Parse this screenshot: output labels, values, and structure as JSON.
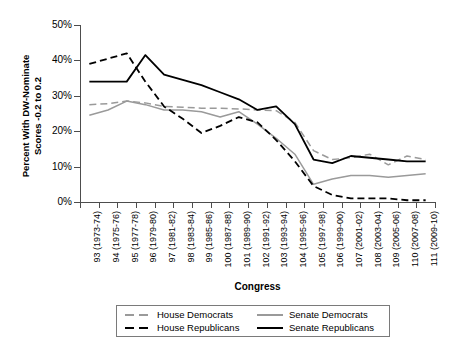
{
  "axes": {
    "y_title_line1": "Percent With DW-Nominate",
    "y_title_line2": "Scores -0.2 to 0.2",
    "x_title": "Congress",
    "y_ticks": [
      "0%",
      "10%",
      "20%",
      "30%",
      "40%",
      "50%"
    ]
  },
  "legend": {
    "items": [
      {
        "label": "House Democrats",
        "style": "dashed",
        "color": "#9a9a9a"
      },
      {
        "label": "Senate Democrats",
        "style": "solid",
        "color": "#9a9a9a"
      },
      {
        "label": "House Republicans",
        "style": "dashed",
        "color": "#000000"
      },
      {
        "label": "Senate Republicans",
        "style": "solid",
        "color": "#000000"
      }
    ]
  },
  "chart_data": {
    "type": "line",
    "title": "",
    "xlabel": "Congress",
    "ylabel": "Percent With DW-Nominate Scores -0.2 to 0.2",
    "ylim": [
      0,
      50
    ],
    "yticks": [
      0,
      10,
      20,
      30,
      40,
      50
    ],
    "ytick_labels": [
      "0%",
      "10%",
      "20%",
      "30%",
      "40%",
      "50%"
    ],
    "grid": false,
    "legend_position": "below-axis",
    "categories": [
      "93 (1973-74)",
      "94 (1975-76)",
      "95 (1977-78)",
      "96 (1979-80)",
      "97 (1981-82)",
      "98 (1983-84)",
      "99 (1985-86)",
      "100 (1987-88)",
      "101 (1989-90)",
      "102 (1991-92)",
      "103 (1993-94)",
      "104 (1995-96)",
      "105 (1997-98)",
      "106 (1999-00)",
      "107 (2001-02)",
      "108 (2003-04)",
      "109 (2005-06)",
      "110 (2007-08)",
      "111 (2009-10)"
    ],
    "series": [
      {
        "name": "House Democrats",
        "style": "dashed",
        "color": "#9a9a9a",
        "values": [
          27.5,
          27.8,
          28.5,
          28.0,
          27.0,
          26.8,
          26.5,
          26.5,
          26.3,
          26.0,
          25.8,
          22.5,
          14.5,
          12.0,
          12.5,
          13.5,
          10.5,
          13.0,
          12.0
        ]
      },
      {
        "name": "Senate Democrats",
        "style": "solid",
        "color": "#9a9a9a",
        "values": [
          24.5,
          26.0,
          28.5,
          27.5,
          26.0,
          26.0,
          25.5,
          24.0,
          25.5,
          22.0,
          18.0,
          13.5,
          5.0,
          6.5,
          7.5,
          7.5,
          7.0,
          7.5,
          8.0
        ]
      },
      {
        "name": "House Republicans",
        "style": "dashed",
        "color": "#000000",
        "values": [
          39.0,
          40.5,
          42.0,
          34.0,
          27.0,
          23.5,
          19.5,
          21.5,
          24.0,
          22.5,
          17.5,
          11.5,
          4.5,
          2.0,
          1.0,
          1.0,
          1.0,
          0.5,
          0.5
        ]
      },
      {
        "name": "Senate Republicans",
        "style": "solid",
        "color": "#000000",
        "values": [
          34.0,
          34.0,
          34.0,
          41.5,
          36.0,
          34.5,
          33.0,
          31.0,
          29.0,
          26.0,
          27.0,
          22.0,
          12.0,
          11.0,
          13.0,
          12.5,
          12.0,
          11.5,
          11.5
        ]
      }
    ]
  }
}
